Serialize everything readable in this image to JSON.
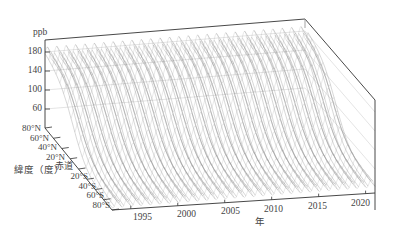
{
  "chart_data": {
    "type": "surface3d",
    "title": "",
    "zlabel": "ppb",
    "ylabel": "緯度（度）",
    "xlabel": "年",
    "z_ticks": [
      "180",
      "140",
      "100",
      "60"
    ],
    "z_range": [
      40,
      200
    ],
    "lat_ticks": [
      "80°N",
      "60°N",
      "40°N",
      "20°N",
      "赤道",
      "20°S",
      "40°S",
      "60°S",
      "80°S"
    ],
    "x_ticks": [
      "1995",
      "2000",
      "2005",
      "2010",
      "2015",
      "2020"
    ],
    "x_range": [
      1993,
      2021
    ],
    "series_summary": {
      "north_high_ppb": 180,
      "south_low_ppb": 50,
      "cycles_per_year": 1,
      "years": [
        1993,
        2021
      ]
    },
    "grid": true,
    "line_color": "#8a8a8a"
  },
  "labels": {
    "z_unit": "ppb",
    "lat_axis_title": "緯度（度）",
    "equator": "赤道",
    "year_axis_title": "年"
  }
}
